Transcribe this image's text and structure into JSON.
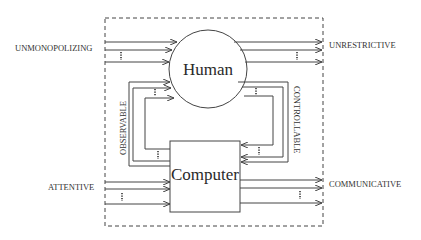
{
  "diagram": {
    "nodes": {
      "human": {
        "label": "Human"
      },
      "computer": {
        "label": "Computer"
      }
    },
    "labels": {
      "input_human": "UNMONOPOLIZING",
      "output_human": "UNRESTRICTIVE",
      "input_computer": "ATTENTIVE",
      "output_computer": "COMMUNICATIVE",
      "loop_left": "OBSERVABLE",
      "loop_right": "CONTROLLABLE"
    },
    "colors": {
      "line": "#444444",
      "text": "#333333",
      "background": "#ffffff"
    }
  }
}
